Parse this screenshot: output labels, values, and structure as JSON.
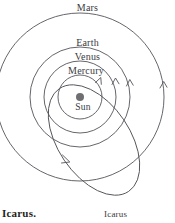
{
  "figure": {
    "kind": "orbit-diagram",
    "background_color": "#ffffff",
    "stroke_color": "#55545a",
    "sun_color": "#6f6f72",
    "caption": "Icarus."
  },
  "center": {
    "label": "Sun",
    "x": 80,
    "y": 97,
    "radius": 4
  },
  "orbits": [
    {
      "name": "mercury",
      "label": "Mercury",
      "radius": 22,
      "direction": "counterclockwise"
    },
    {
      "name": "venus",
      "label": "Venus",
      "radius": 36,
      "direction": "counterclockwise"
    },
    {
      "name": "earth",
      "label": "Earth",
      "radius": 50,
      "direction": "counterclockwise"
    },
    {
      "name": "mars",
      "label": "Mars",
      "radius": 84,
      "direction": "counterclockwise"
    }
  ],
  "eccentric_orbit": {
    "name": "icarus",
    "label": "Icarus",
    "direction": "counterclockwise",
    "description": "highly elliptical tilted orbit crossing the inner planet orbits"
  },
  "labels": {
    "mars": "Mars",
    "earth": "Earth",
    "venus": "Venus",
    "mercury": "Mercury",
    "sun": "Sun",
    "icarus_orbit": "Icarus",
    "caption": "Icarus."
  }
}
